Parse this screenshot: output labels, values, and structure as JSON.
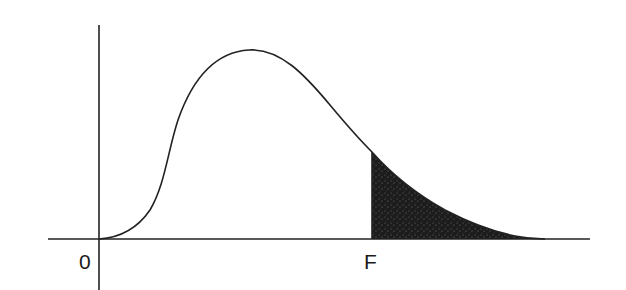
{
  "diagram": {
    "type": "probability-density-curve",
    "labels": {
      "origin": "0",
      "critical_value": "F"
    },
    "colors": {
      "curve": "#222222",
      "axes": "#222222",
      "shaded_tail": "#1c1c1c",
      "background": "#ffffff"
    },
    "geometry": {
      "x_axis_y": 239,
      "x_axis_from": 48,
      "x_axis_to": 590,
      "y_axis_x": 99,
      "y_axis_from": 25,
      "y_axis_to": 290,
      "peak": [
        249,
        50
      ],
      "critical_x": 372,
      "critical_curve_y": 152,
      "tail_end_x": 535
    }
  }
}
